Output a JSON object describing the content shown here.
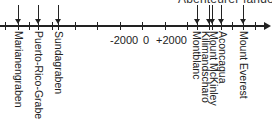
{
  "caption": "Abenteurer fanden.",
  "axis": {
    "tick_labels": [
      {
        "label": "-2000",
        "x": 110
      },
      {
        "label": "0",
        "x": 143
      },
      {
        "label": "+2000",
        "x": 156
      }
    ],
    "ticks_x": [
      5,
      18,
      29,
      38,
      52,
      58,
      75,
      97,
      120,
      142,
      165,
      187,
      197,
      209,
      212,
      221,
      232,
      243,
      255
    ]
  },
  "markers": [
    {
      "label": "Marianengraben",
      "x": 18
    },
    {
      "label": "Puerto-Rico-Graben",
      "x": 38
    },
    {
      "label": "Sundagraben",
      "x": 58
    },
    {
      "label": "Montblanc",
      "x": 197
    },
    {
      "label": "Kilimandscharo",
      "x": 205
    },
    {
      "label": "Mount McKinley",
      "x": 212
    },
    {
      "label": "Aconcagua",
      "x": 221
    },
    {
      "label": "Mount Everest",
      "x": 243
    }
  ]
}
